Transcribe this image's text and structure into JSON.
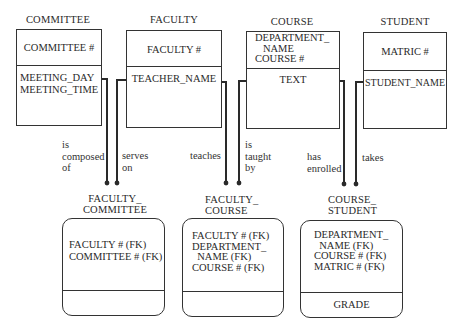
{
  "entities": [
    {
      "name": "COMMITTEE",
      "key": [
        "COMMITTEE #"
      ],
      "attributes": [
        "MEETING_DAY",
        "MEETING_TIME"
      ],
      "key_display": "COMMITTEE #",
      "attr_display": "MEETING_DAY\nMEETING_TIME"
    },
    {
      "name": "FACULTY",
      "key": [
        "FACULTY #"
      ],
      "attributes": [
        "TEACHER_NAME"
      ],
      "key_display": "FACULTY #",
      "attr_display": "TEACHER_NAME"
    },
    {
      "name": "COURSE",
      "key": [
        "DEPARTMENT_NAME",
        "COURSE #"
      ],
      "attributes": [
        "TEXT"
      ],
      "key_display": "DEPARTMENT_\n   NAME\nCOURSE #",
      "attr_display": "TEXT"
    },
    {
      "name": "STUDENT",
      "key": [
        "MATRIC #"
      ],
      "attributes": [
        "STUDENT_NAME"
      ],
      "key_display": "MATRIC #",
      "attr_display": "STUDENT_NAME"
    }
  ],
  "associations": [
    {
      "name_display": "FACULTY_\nCOMMITTEE",
      "name": "FACULTY_COMMITTEE",
      "keys": [
        "FACULTY # (FK)",
        "COMMITTEE # (FK)"
      ],
      "key_display": "FACULTY # (FK)\nCOMMITTEE # (FK)",
      "attributes": [],
      "attr_display": ""
    },
    {
      "name_display": "FACULTY_\nCOURSE",
      "name": "FACULTY_COURSE",
      "keys": [
        "FACULTY # (FK)",
        "DEPARTMENT_NAME (FK)",
        "COURSE # (FK)"
      ],
      "key_display": "FACULTY # (FK)\nDEPARTMENT_\n  NAME (FK)\nCOURSE # (FK)",
      "attributes": [],
      "attr_display": ""
    },
    {
      "name_display": "COURSE_\nSTUDENT",
      "name": "COURSE_STUDENT",
      "keys": [
        "DEPARTMENT_NAME (FK)",
        "COURSE # (FK)",
        "MATRIC # (FK)"
      ],
      "key_display": "DEPARTMENT_\n  NAME (FK)\nCOURSE # (FK)\nMATRIC # (FK)",
      "attributes": [
        "GRADE"
      ],
      "attr_display": "GRADE"
    }
  ],
  "relationships": [
    {
      "from": "COMMITTEE",
      "to": "FACULTY_COMMITTEE",
      "label": "is\ncomposed\nof"
    },
    {
      "from": "FACULTY",
      "to": "FACULTY_COMMITTEE",
      "label": "serves\non"
    },
    {
      "from": "FACULTY",
      "to": "FACULTY_COURSE",
      "label": "teaches"
    },
    {
      "from": "COURSE",
      "to": "FACULTY_COURSE",
      "label": "is\ntaught\nby"
    },
    {
      "from": "COURSE",
      "to": "COURSE_STUDENT",
      "label": "has\nenrolled"
    },
    {
      "from": "STUDENT",
      "to": "COURSE_STUDENT",
      "label": "takes"
    }
  ],
  "colors": {
    "line": "#2a2a2a",
    "background": "#ffffff"
  }
}
